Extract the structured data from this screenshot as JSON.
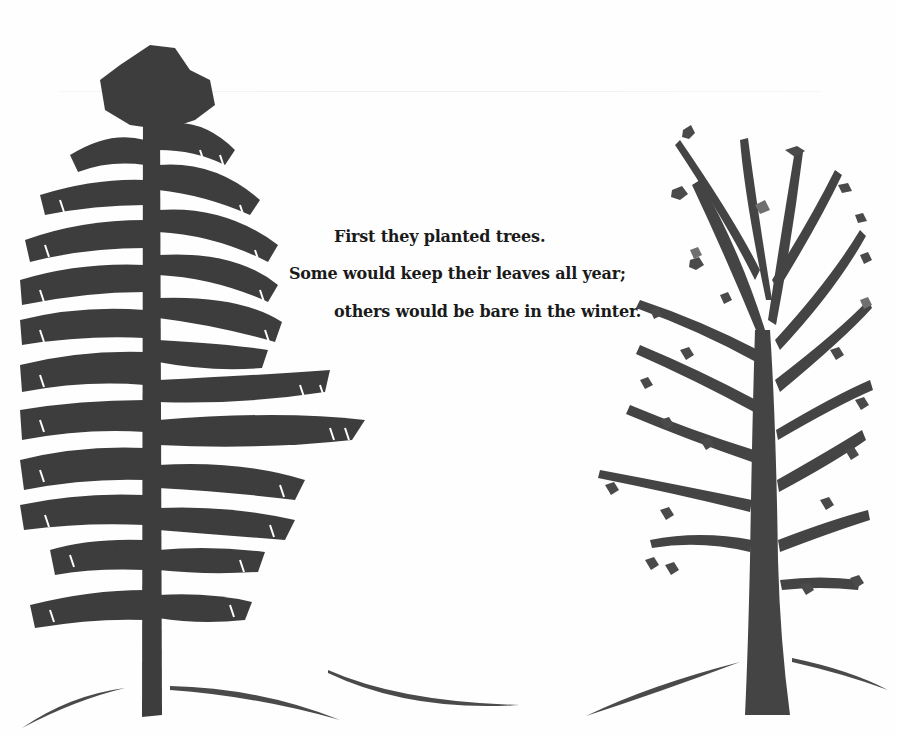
{
  "story": {
    "line1": "First they planted trees.",
    "line2": "Some would keep their leaves all year;",
    "line3": "others would be bare in the winter."
  },
  "illustration": {
    "left_tree": "evergreen-pine-tree",
    "right_tree": "deciduous-tree",
    "ground": "snowy-hill-strokes",
    "colors": {
      "background": "#fefefe",
      "tree_dark": "#3d3d3d",
      "tree_mid": "#5a5a5a",
      "text": "#1a1a1a"
    }
  }
}
